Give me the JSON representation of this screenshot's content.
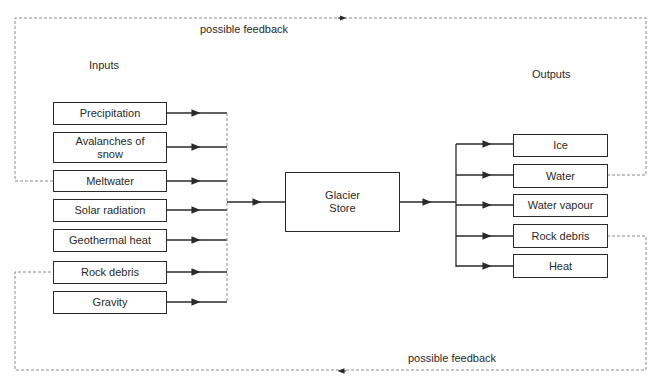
{
  "diagram": {
    "title_inputs": "Inputs",
    "title_outputs": "Outputs",
    "center": {
      "label_line1": "Glacier",
      "label_line2": "Store"
    },
    "inputs": [
      {
        "label": "Precipitation"
      },
      {
        "label": "Avalanches of snow"
      },
      {
        "label": "Meltwater"
      },
      {
        "label": "Solar radiation"
      },
      {
        "label": "Geothermal heat"
      },
      {
        "label": "Rock debris"
      },
      {
        "label": "Gravity"
      }
    ],
    "outputs": [
      {
        "label": "Ice"
      },
      {
        "label": "Water"
      },
      {
        "label": "Water vapour"
      },
      {
        "label": "Rock debris"
      },
      {
        "label": "Heat"
      }
    ],
    "feedback_top": {
      "label": "possible feedback",
      "from": "Water",
      "to": "Meltwater"
    },
    "feedback_bottom": {
      "label": "possible feedback",
      "from": "Rock debris",
      "to": "Rock debris"
    },
    "colors": {
      "line": "#2a2a2a",
      "dashed": "#8a8a8a",
      "background": "#ffffff"
    }
  }
}
